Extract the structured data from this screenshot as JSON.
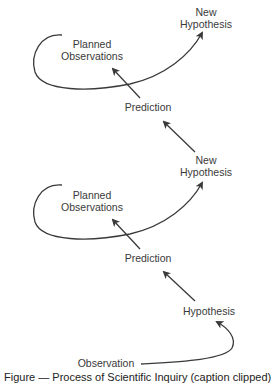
{
  "diagram": {
    "nodes": {
      "top_new_hypothesis": {
        "line1": "New",
        "line2": "Hypothesis"
      },
      "top_planned_observations": {
        "line1": "Planned",
        "line2": "Observations"
      },
      "top_prediction": {
        "label": "Prediction"
      },
      "mid_new_hypothesis": {
        "line1": "New",
        "line2": "Hypothesis"
      },
      "mid_planned_observations": {
        "line1": "Planned",
        "line2": "Observations"
      },
      "mid_prediction": {
        "label": "Prediction"
      },
      "hypothesis": {
        "label": "Hypothesis"
      },
      "observation": {
        "label": "Observation"
      }
    },
    "edges": [
      {
        "from": "Observation",
        "to": "Hypothesis"
      },
      {
        "from": "Hypothesis",
        "to": "Prediction"
      },
      {
        "from": "Prediction",
        "to": "Planned Observations"
      },
      {
        "from": "Planned Observations",
        "to": "New Hypothesis"
      },
      {
        "from": "New Hypothesis",
        "to": "Prediction"
      },
      {
        "from": "Prediction",
        "to": "Planned Observations"
      },
      {
        "from": "Planned Observations",
        "to": "New Hypothesis"
      }
    ],
    "colors": {
      "arrow": "#3a3a3a",
      "text": "#3a3a3a"
    }
  },
  "caption": {
    "text": "Figure — Process of Scientific Inquiry (caption clipped)"
  }
}
